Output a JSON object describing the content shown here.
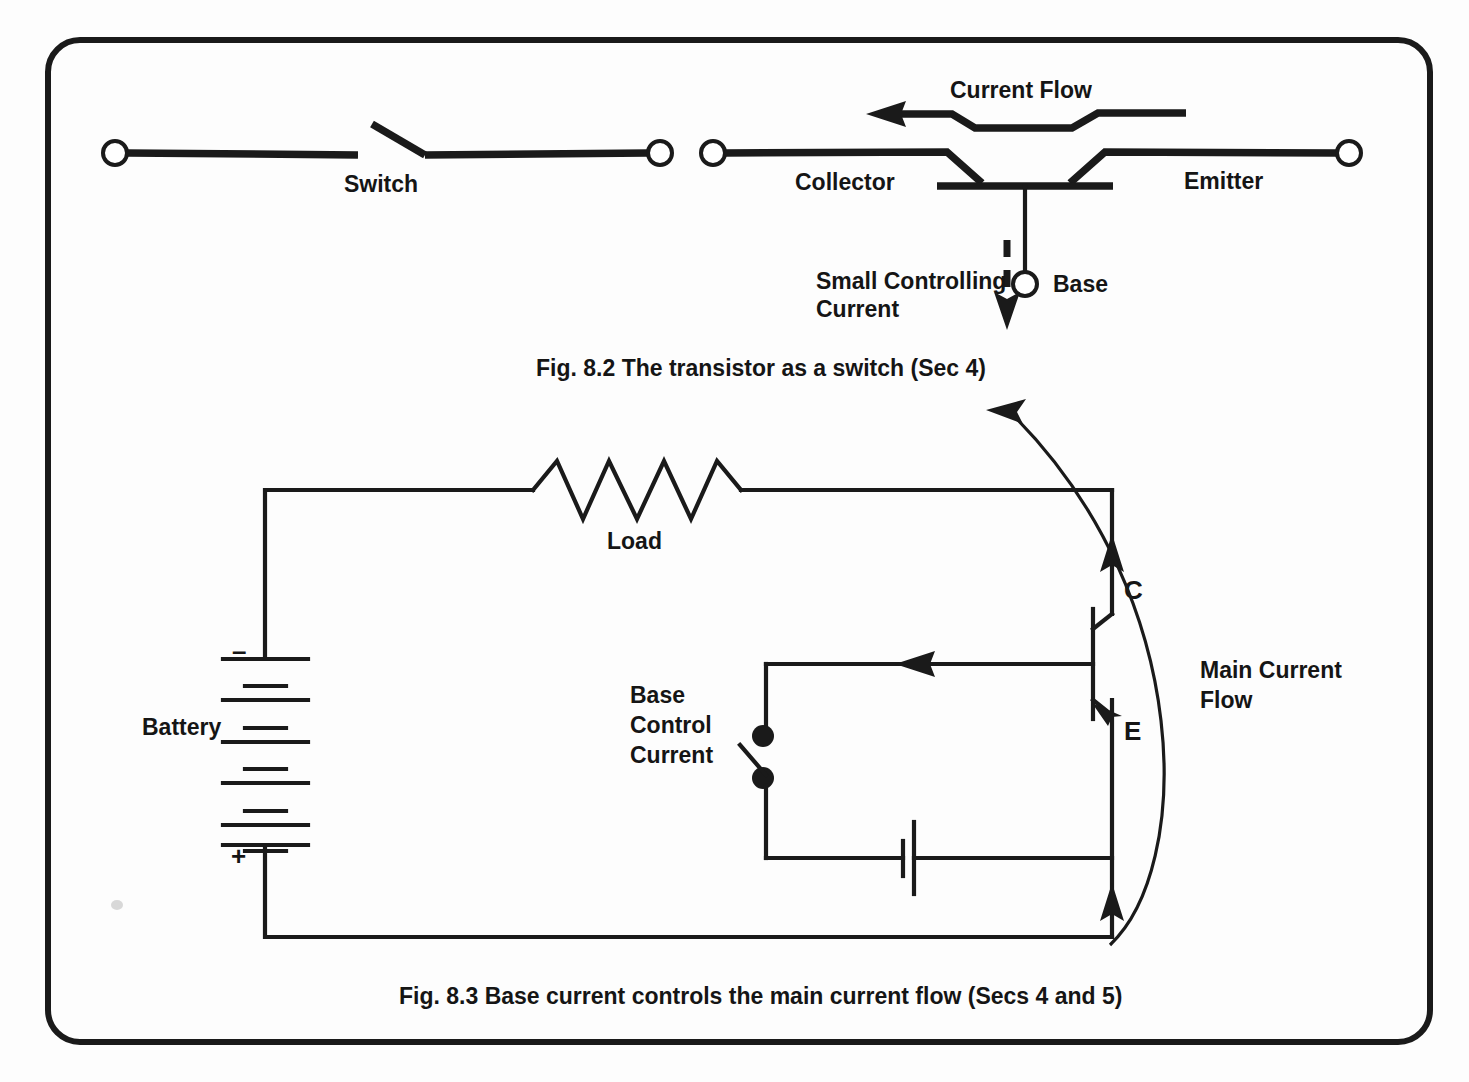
{
  "page": {
    "background_color": "#fdfdfd",
    "ink_color": "#1a1a1a"
  },
  "figure_8_2": {
    "caption": "Fig. 8.2 The transistor as a switch (Sec 4)",
    "switch_label": "Switch",
    "current_flow_label": "Current Flow",
    "collector_label": "Collector",
    "emitter_label": "Emitter",
    "base_label": "Base",
    "small_controlling_line1": "Small Controlling",
    "small_controlling_line2": "Current"
  },
  "figure_8_3": {
    "caption": "Fig. 8.3 Base current controls the main current flow (Secs 4 and 5)",
    "load_label": "Load",
    "battery_label": "Battery",
    "battery_negative": "–",
    "battery_positive": "+",
    "base_control_line1": "Base",
    "base_control_line2": "Control",
    "base_control_line3": "Current",
    "collector_terminal": "C",
    "emitter_terminal": "E",
    "main_current_line1": "Main Current",
    "main_current_line2": "Flow"
  }
}
